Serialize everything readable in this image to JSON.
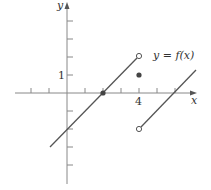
{
  "graph": {
    "function_label": "y = f(x)",
    "x_axis_label": "x",
    "y_axis_label": "y",
    "x_tick_label": "4",
    "y_tick_label": "1",
    "axis_color": "#888888",
    "curve_color": "#555555",
    "x_range": [
      -3,
      7.5
    ],
    "y_range": [
      -5,
      5
    ],
    "pieces": [
      {
        "formula": "x - 2",
        "from": [
          -1,
          -3
        ],
        "to": [
          4,
          2
        ],
        "end": "open"
      },
      {
        "formula": "x - 6",
        "from": [
          4,
          -2
        ],
        "to": [
          7.3,
          1.3
        ],
        "start": "open"
      }
    ],
    "points": [
      {
        "x": 4,
        "y": 2,
        "type": "open"
      },
      {
        "x": 4,
        "y": 1,
        "type": "filled"
      },
      {
        "x": 4,
        "y": -2,
        "type": "open"
      },
      {
        "x": 2,
        "y": 0,
        "type": "filled"
      }
    ]
  }
}
